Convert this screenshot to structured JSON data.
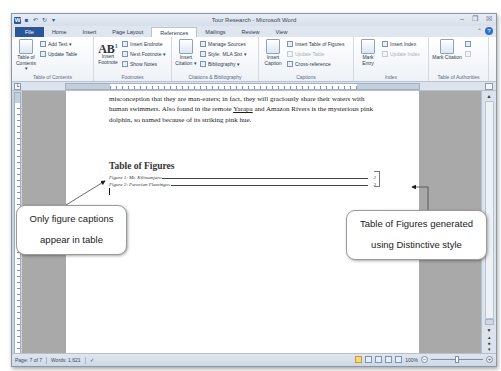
{
  "window": {
    "title": "Tour Research - Microsoft Word",
    "qat_icons": [
      "word-icon",
      "save-icon",
      "undo-icon",
      "redo-icon",
      "customize-icon"
    ],
    "controls": {
      "minimize": "–",
      "restore": "❐",
      "close": "☒"
    }
  },
  "tabs": [
    {
      "label": "File",
      "active": false
    },
    {
      "label": "Home",
      "active": false
    },
    {
      "label": "Insert",
      "active": false
    },
    {
      "label": "Page Layout",
      "active": false
    },
    {
      "label": "References",
      "active": true
    },
    {
      "label": "Mailings",
      "active": false
    },
    {
      "label": "Review",
      "active": false
    },
    {
      "label": "View",
      "active": false
    }
  ],
  "help": {
    "minimize_ribbon": "⌃",
    "help": "?"
  },
  "ribbon": {
    "toc": {
      "label": "Table of Contents",
      "big": "Table of Contents ▾",
      "add_text": "Add Text ▾",
      "update_table": "Update Table"
    },
    "footnotes": {
      "label": "Footnotes",
      "insert_footnote": "Insert Footnote",
      "ab_glyph": "AB",
      "ab_sup": "1",
      "insert_endnote": "Insert Endnote",
      "next_footnote": "Next Footnote ▾",
      "show_notes": "Show Notes",
      "launcher": "↘"
    },
    "citations": {
      "label": "Citations & Bibliography",
      "insert_citation": "Insert Citation ▾",
      "manage_sources": "Manage Sources",
      "style_label": "Style:",
      "style_value": "MLA Sixt ▾",
      "bibliography": "Bibliography ▾"
    },
    "captions": {
      "label": "Captions",
      "insert_caption": "Insert Caption",
      "insert_tof": "Insert Table of Figures",
      "update_table": "Update Table",
      "cross_reference": "Cross-reference"
    },
    "index": {
      "label": "Index",
      "mark_entry": "Mark Entry",
      "insert_index": "Insert Index",
      "update_index": "Update Index"
    },
    "toa": {
      "label": "Table of Authorities",
      "mark_citation": "Mark Citation"
    }
  },
  "document": {
    "paragraph_line1": "misconception that they are man-eaters; in fact, they will graciously share their waters with",
    "paragraph_line2_a": "human swimmers. Also found in the remote ",
    "paragraph_line2_u": "Yarapa",
    "paragraph_line2_b": " and Amazon Rivers is the mysterious pink",
    "paragraph_line3": "dolphin, so named because of its striking pink hue.",
    "tof_heading": "Table of Figures",
    "tof_entries": [
      {
        "caption": "Figure 1: Mt. Kilimanjaro",
        "page": "2"
      },
      {
        "caption": "Figure 2: Peruvian Flamingos",
        "page": "3"
      }
    ]
  },
  "callouts": {
    "left_line1": "Only figure captions",
    "left_line2": "appear in table",
    "right_line1": "Table of Figures generated",
    "right_line2": "using Distinctive style"
  },
  "statusbar": {
    "page": "Page: 7 of 7",
    "words": "Words: 1,621",
    "zoom_level": "100%",
    "zoom_out": "–",
    "zoom_in": "+"
  }
}
